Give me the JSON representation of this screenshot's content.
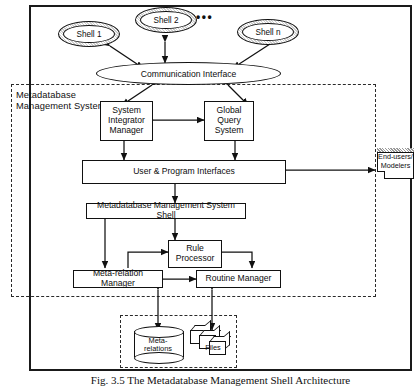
{
  "figure": {
    "caption": "Fig. 3.5  The Metadatabase Management Shell Architecture",
    "ellipsis": "•••"
  },
  "regions": {
    "mdbms_label": "Metadatabase Management System",
    "store_label": ""
  },
  "shells": [
    {
      "id": "shell-1",
      "label": "Shell 1"
    },
    {
      "id": "shell-2",
      "label": "Shell 2"
    },
    {
      "id": "shell-n",
      "label": "Shell n"
    }
  ],
  "nodes": {
    "communication_interface": "Communication Interface",
    "system_integrator_manager": "System Integrator Manager",
    "global_query_system": "Global Query System",
    "user_program_interfaces": "User & Program Interfaces",
    "mdbms_shell": "Metadatabase Management System Shell",
    "rule_processor": "Rule Processor",
    "meta_relation_manager": "Meta-relation Manager",
    "routine_manager": "Routine Manager",
    "end_users_modelers_line1": "End-users/",
    "end_users_modelers_line2": "Modelers",
    "meta_relations_line1": "Meta-",
    "meta_relations_line2": "relations",
    "files": "Files"
  },
  "colors": {
    "stroke": "#111111",
    "frame": "#1a1a1a",
    "dashed": "#2a2a2a",
    "background": "#ffffff"
  }
}
